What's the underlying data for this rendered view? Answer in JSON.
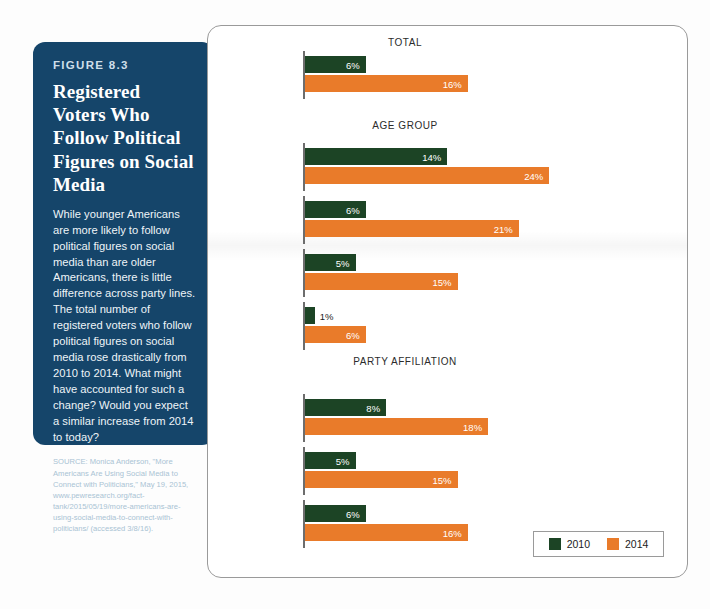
{
  "figure": {
    "number": "FIGURE 8.3",
    "title": "Registered Voters Who Follow Political Figures on Social Media",
    "body": "While younger Americans are more likely to follow political figures on social media than are older Americans, there is little difference across party lines. The total number of registered voters who follow political figures on social media rose drastically from 2010 to 2014. What might have accounted for such a change? Would you expect a similar increase from 2014 to today?",
    "source": "SOURCE: Monica Anderson, \"More Americans Are Using Social Media to Connect with Politicians,\" May 19, 2015, www.pewresearch.org/fact-tank/2015/05/19/more-americans-are-using-social-media-to-connect-with-politicians/ (accessed 3/8/16)."
  },
  "legend": {
    "items": [
      {
        "label": "2010",
        "color": "#1c4425"
      },
      {
        "label": "2014",
        "color": "#e97b2a"
      }
    ]
  },
  "chart_data": {
    "type": "bar",
    "title": "Registered Voters Who Follow Political Figures on Social Media",
    "xlabel": "",
    "ylabel": "",
    "xlim": [
      0,
      26
    ],
    "grid": false,
    "orientation": "horizontal",
    "legend_position": "bottom-right",
    "value_suffix": "%",
    "series": [
      {
        "name": "2010",
        "color": "#1c4425"
      },
      {
        "name": "2014",
        "color": "#e97b2a"
      }
    ],
    "sections": [
      {
        "title": "TOTAL",
        "categories": [
          ""
        ],
        "rows": [
          {
            "category": "",
            "values": [
              6,
              16
            ],
            "labels": [
              "6%",
              "16%"
            ]
          }
        ]
      },
      {
        "title": "AGE GROUP",
        "categories": [
          "18–29",
          "30–49",
          "50–64",
          "65+"
        ],
        "rows": [
          {
            "category": "18–29",
            "values": [
              14,
              24
            ],
            "labels": [
              "14%",
              "24%"
            ]
          },
          {
            "category": "30–49",
            "values": [
              6,
              21
            ],
            "labels": [
              "6%",
              "21%"
            ]
          },
          {
            "category": "50–64",
            "values": [
              5,
              15
            ],
            "labels": [
              "5%",
              "15%"
            ]
          },
          {
            "category": "65+",
            "values": [
              1,
              6
            ],
            "labels": [
              "1%",
              "6%"
            ]
          }
        ]
      },
      {
        "title": "PARTY AFFILIATION",
        "categories": [
          "Republican",
          "Democrat",
          "Independent"
        ],
        "rows": [
          {
            "category": "Republican",
            "values": [
              8,
              18
            ],
            "labels": [
              "8%",
              "18%"
            ]
          },
          {
            "category": "Democrat",
            "values": [
              5,
              15
            ],
            "labels": [
              "5%",
              "15%"
            ]
          },
          {
            "category": "Independent",
            "values": [
              6,
              16
            ],
            "labels": [
              "6%",
              "16%"
            ]
          }
        ]
      }
    ]
  }
}
